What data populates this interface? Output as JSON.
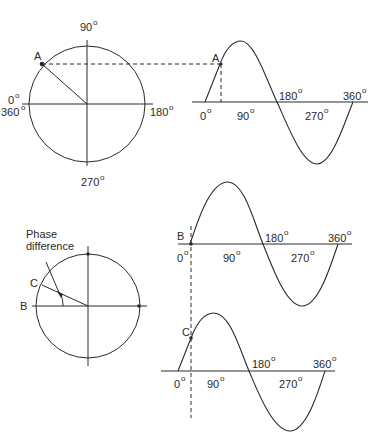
{
  "figure": {
    "top": {
      "phasor_diagram": {
        "labels": {
          "top": "90",
          "left_top": "0",
          "left_bottom": "360",
          "right": "180",
          "bottom": "270"
        },
        "degree_symbol": "o",
        "point_label": "A"
      },
      "waveform": {
        "point_label": "A",
        "axis_labels": {
          "start": "0",
          "quarter": "90",
          "half": "180",
          "three_quarter": "270",
          "full": "360"
        },
        "degree_symbol": "o"
      }
    },
    "bottom": {
      "phasor_diagram": {
        "annotation_line1": "Phase",
        "annotation_line2": "difference",
        "reference_label": "B",
        "phasor_label": "C"
      },
      "waveform_b": {
        "point_label": "B",
        "axis_labels": {
          "start": "0",
          "quarter": "90",
          "half": "180",
          "three_quarter": "270",
          "full": "360"
        },
        "degree_symbol": "o"
      },
      "waveform_c": {
        "point_label": "C",
        "axis_labels": {
          "start": "0",
          "quarter": "90",
          "half": "180",
          "three_quarter": "270",
          "full": "360"
        },
        "degree_symbol": "o"
      }
    }
  }
}
